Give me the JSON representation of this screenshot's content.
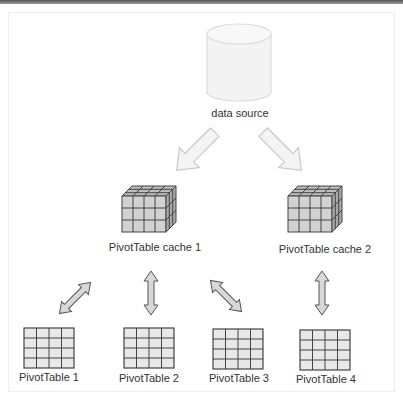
{
  "diagram": {
    "source": {
      "label": "data source",
      "icon": "database-cylinder-icon"
    },
    "caches": [
      {
        "label": "PivotTable cache 1",
        "icon": "cube-grid-icon"
      },
      {
        "label": "PivotTable cache 2",
        "icon": "cube-grid-icon"
      }
    ],
    "tables": [
      {
        "label": "PivotTable 1",
        "cache": 1,
        "icon": "table-grid-icon"
      },
      {
        "label": "PivotTable 2",
        "cache": 1,
        "icon": "table-grid-icon"
      },
      {
        "label": "PivotTable 3",
        "cache": 1,
        "icon": "table-grid-icon"
      },
      {
        "label": "PivotTable 4",
        "cache": 2,
        "icon": "table-grid-icon"
      }
    ],
    "connectors": {
      "source_to_cache": "one-way-arrow",
      "cache_to_table": "two-way-arrow"
    },
    "colors": {
      "cube_fill": "#cfcfcf",
      "cube_stroke": "#444444",
      "arrow_fill_light": "#f3f3f3",
      "arrow_fill_dark": "#d0d0d0",
      "cylinder_fill": "#f2f2f2"
    }
  }
}
